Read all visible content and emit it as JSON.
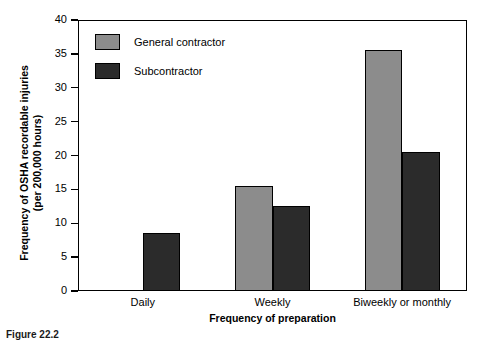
{
  "chart_data": {
    "type": "bar",
    "title": "",
    "xlabel": "Frequency of preparation",
    "ylabel_line1": "Frequency of OSHA recordable injuries",
    "ylabel_line2": "(per 200,000 hours)",
    "categories": [
      "Daily",
      "Weekly",
      "Biweekly or monthly"
    ],
    "series": [
      {
        "name": "General contractor",
        "color": "#8c8c8c",
        "values": [
          null,
          15.5,
          35.5
        ]
      },
      {
        "name": "Subcontractor",
        "color": "#2b2b2b",
        "values": [
          8.5,
          12.5,
          20.5
        ]
      }
    ],
    "ylim": [
      0,
      40
    ],
    "yticks": [
      0,
      5,
      10,
      15,
      20,
      25,
      30,
      35,
      40
    ],
    "ytick_labels": [
      "0",
      "5",
      "10",
      "15",
      "20",
      "25",
      "30",
      "35",
      "40"
    ],
    "grid": false,
    "legend_position": "upper-left-inside"
  },
  "legend": {
    "items": [
      {
        "label": "General contractor",
        "color": "#8c8c8c"
      },
      {
        "label": "Subcontractor",
        "color": "#2b2b2b"
      }
    ]
  },
  "caption": "Figure 22.2"
}
